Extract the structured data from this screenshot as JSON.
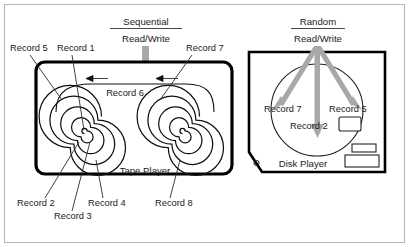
{
  "figure": {
    "caption_left": {
      "title": "Sequential",
      "subtitle": "Read/Write"
    },
    "caption_right": {
      "title": "Random",
      "subtitle": "Read/Write"
    },
    "devices": {
      "tape": "Tape  Player",
      "disk": "Disk Player"
    },
    "tape_labels": {
      "record5": "Record 5",
      "record1": "Record 1",
      "record7": "Record 7",
      "record6": "Record 6",
      "record2": "Record 2",
      "record3": "Record 3",
      "record4": "Record 4",
      "record8": "Record 8"
    },
    "disk_labels": {
      "record7": "Record 7",
      "record5": "Record 5",
      "record2": "Record 2"
    },
    "disk_marker": "o",
    "colors": {
      "ink": "#111111",
      "arrow_gray": "#a8a8a8",
      "frame": "#b9b9b9",
      "label_ink": "#1a1a1a"
    }
  }
}
